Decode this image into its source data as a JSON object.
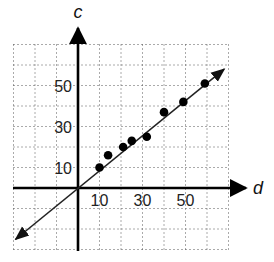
{
  "chart_data": {
    "type": "scatter",
    "title": "",
    "xlabel": "d",
    "ylabel": "c",
    "xlim": [
      -30,
      70
    ],
    "ylim": [
      -30,
      70
    ],
    "grid": true,
    "grid_step": 10,
    "x_tick_labels": [
      {
        "value": 10,
        "label": "10"
      },
      {
        "value": 30,
        "label": "30"
      },
      {
        "value": 50,
        "label": "50"
      }
    ],
    "y_tick_labels": [
      {
        "value": 10,
        "label": "10"
      },
      {
        "value": 30,
        "label": "30"
      },
      {
        "value": 50,
        "label": "50"
      }
    ],
    "series": [
      {
        "name": "data points",
        "type": "scatter",
        "points": [
          {
            "x": 10,
            "y": 10
          },
          {
            "x": 14,
            "y": 16
          },
          {
            "x": 21,
            "y": 20
          },
          {
            "x": 25,
            "y": 23
          },
          {
            "x": 32,
            "y": 25
          },
          {
            "x": 40,
            "y": 37
          },
          {
            "x": 49,
            "y": 42
          },
          {
            "x": 59,
            "y": 51
          }
        ]
      },
      {
        "name": "line of fit",
        "type": "line",
        "arrows_both_ends": true,
        "points": [
          {
            "x": -29,
            "y": -25
          },
          {
            "x": 68,
            "y": 58
          }
        ]
      }
    ],
    "colors": {
      "axis": "#000000",
      "grid": "#555555",
      "points": "#000000",
      "line": "#222222"
    }
  }
}
